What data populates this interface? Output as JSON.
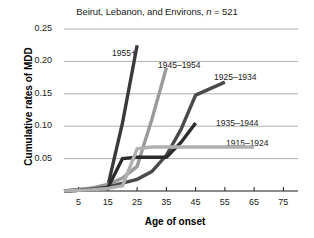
{
  "chart_data": {
    "type": "line",
    "title": "Beirut, Lebanon, and Environs, n = 521",
    "title_prefix": "Beirut, Lebanon, and Environs, ",
    "title_italic": "n",
    "title_suffix": " = 521",
    "xlabel": "Age of onset",
    "ylabel": "Cumulative rates of MDD",
    "xlim": [
      0,
      80
    ],
    "ylim": [
      0,
      0.25
    ],
    "grid": true,
    "grid_axis": "y",
    "legend": "inline-annotations",
    "xticks": [
      5,
      15,
      25,
      35,
      45,
      55,
      65,
      75
    ],
    "xtick_labels": [
      "5",
      "15",
      "25",
      "35",
      "45",
      "55",
      "65",
      "75"
    ],
    "yticks": [
      0.05,
      0.1,
      0.15,
      0.2,
      0.25
    ],
    "ytick_labels": [
      "0.05",
      "0.10",
      "0.15",
      "0.20",
      "0.25"
    ],
    "series": [
      {
        "name": "1955+",
        "color": "#3a3a3a",
        "label_x": 112,
        "label_y": 48,
        "x": [
          0,
          5,
          10,
          15,
          20,
          25
        ],
        "y": [
          0.0,
          0.002,
          0.004,
          0.008,
          0.105,
          0.225
        ]
      },
      {
        "name": "1945–1954",
        "color": "#9a9a9a",
        "label_x": 158,
        "label_y": 60,
        "x": [
          0,
          5,
          10,
          15,
          20,
          25,
          30,
          35
        ],
        "y": [
          0.0,
          0.002,
          0.005,
          0.01,
          0.02,
          0.038,
          0.11,
          0.19
        ]
      },
      {
        "name": "1925–1934",
        "color": "#4a4a4a",
        "label_x": 214,
        "label_y": 72,
        "x": [
          0,
          5,
          10,
          15,
          20,
          25,
          30,
          35,
          40,
          45,
          55
        ],
        "y": [
          0.0,
          0.001,
          0.003,
          0.006,
          0.012,
          0.018,
          0.03,
          0.055,
          0.095,
          0.148,
          0.168
        ]
      },
      {
        "name": "1935–1944",
        "color": "#2b2b2b",
        "label_x": 216,
        "label_y": 118,
        "x": [
          0,
          5,
          10,
          15,
          20,
          25,
          30,
          35,
          40,
          45
        ],
        "y": [
          0.0,
          0.001,
          0.002,
          0.005,
          0.05,
          0.052,
          0.052,
          0.052,
          0.075,
          0.105
        ]
      },
      {
        "name": "1915–1924",
        "color": "#b0b0b0",
        "label_x": 226,
        "label_y": 138,
        "x": [
          0,
          5,
          10,
          15,
          20,
          25,
          30,
          35,
          45,
          55,
          65
        ],
        "y": [
          0.0,
          0.001,
          0.002,
          0.004,
          0.008,
          0.065,
          0.068,
          0.068,
          0.068,
          0.068,
          0.068
        ]
      }
    ]
  }
}
